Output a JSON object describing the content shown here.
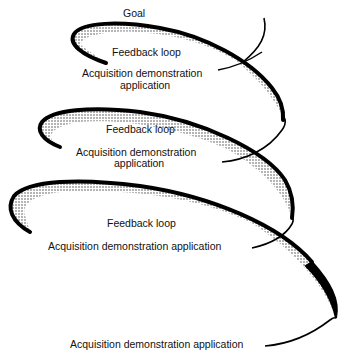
{
  "diagram": {
    "type": "spiral",
    "goal_label": "Goal",
    "loops": [
      {
        "feedback": "Feedback loop",
        "acq_line1": "Acquisition demonstration",
        "acq_line2": "application"
      },
      {
        "feedback": "Feedback loop",
        "acq_line1": "Acquisition demonstration",
        "acq_line2": "application"
      },
      {
        "feedback": "Feedback loop",
        "acq_line1": "Acquisition demonstration application",
        "acq_line2": ""
      }
    ],
    "bottom_label": "Acquisition demonstration application",
    "colors": {
      "stroke": "#000000",
      "background": "#ffffff",
      "shading": "#555555"
    }
  }
}
